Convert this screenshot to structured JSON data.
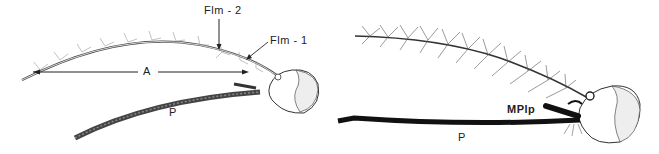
{
  "figure": {
    "left_panel": {
      "subject": "female mosquito head with antenna and proboscis",
      "labels": {
        "flm2": "Flm - 2",
        "flm1": "Flm - 1",
        "antenna_length": "A",
        "proboscis": "P"
      }
    },
    "right_panel": {
      "subject": "male mosquito head with plumose antenna, maxillary palp and proboscis",
      "labels": {
        "maxillary_palp": "MPlp",
        "proboscis": "P"
      }
    },
    "colors": {
      "ink": "#222222",
      "background": "#ffffff"
    }
  }
}
